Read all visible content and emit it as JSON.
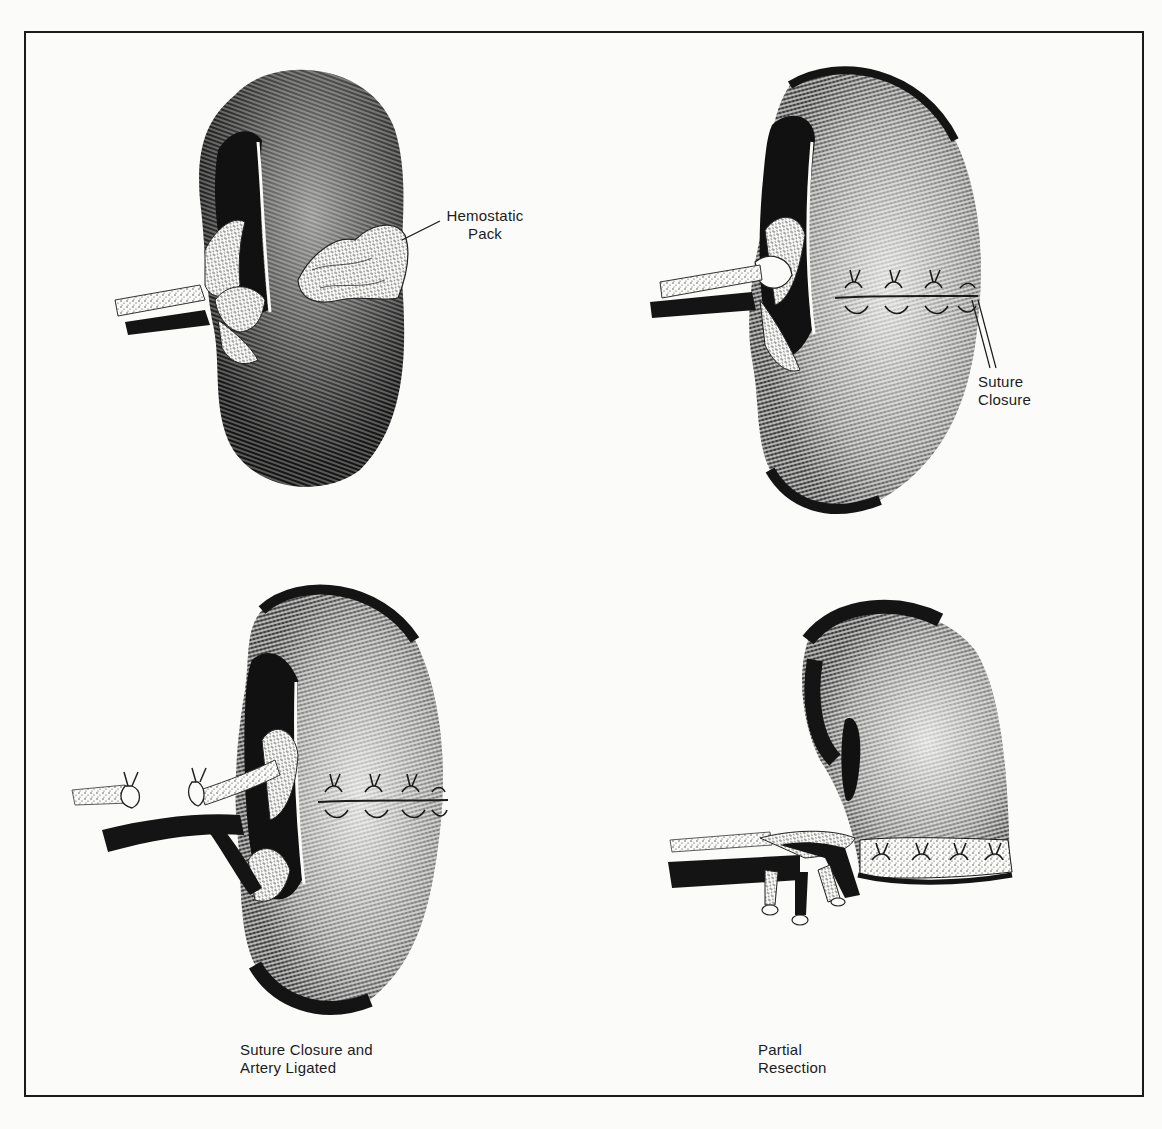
{
  "figure": {
    "type": "medical illustration",
    "panels": [
      {
        "id": "top-left",
        "label_lines": [
          "Hemostatic",
          "Pack"
        ],
        "callout": "Hemostatic Pack"
      },
      {
        "id": "top-right",
        "label_lines": [
          "Suture",
          "Closure"
        ],
        "callout": "Suture Closure"
      },
      {
        "id": "bottom-left",
        "caption_lines": [
          "Suture Closure and",
          "Artery Ligated"
        ]
      },
      {
        "id": "bottom-right",
        "caption_lines": [
          "Partial",
          "Resection"
        ]
      }
    ]
  },
  "colors": {
    "ink": "#141414",
    "paper": "#fbfbfa"
  }
}
